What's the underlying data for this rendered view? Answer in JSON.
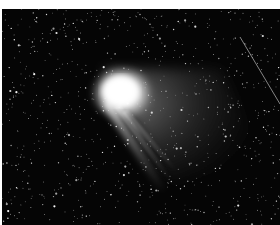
{
  "image": {
    "subject": "comet",
    "description": "Comet with bright coma and fanned dust and ion tails against a dense star field, with a faint diagonal streak at upper right",
    "background_color": "#050505",
    "border_color": "#ffffff",
    "coma_center": [
      120,
      85
    ],
    "tail_direction": "lower-right",
    "streak": {
      "from": [
        240,
        35
      ],
      "to": [
        280,
        100
      ]
    }
  }
}
